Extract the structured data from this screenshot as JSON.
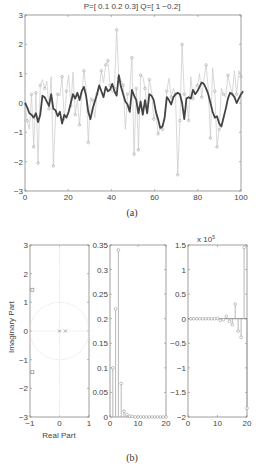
{
  "chart_data": [
    {
      "id": "a",
      "type": "line",
      "title": "P=[ 0.1    0.2    0.3]  Q=[ 1    −0.2]",
      "caption": "(a)",
      "xlabel": "",
      "ylabel": "",
      "xlim": [
        0,
        100
      ],
      "ylim": [
        -3,
        3
      ],
      "xticks": [
        "0",
        "20",
        "40",
        "60",
        "80",
        "100"
      ],
      "yticks": [
        "3",
        "2",
        "1",
        "0",
        "-1",
        "-2",
        "-3"
      ],
      "grid": false,
      "series": [
        {
          "name": "noisy samples (stem, light gray)",
          "style": "thin-gray-with-circles",
          "values": [
            0.0,
            -0.6,
            -0.9,
            0.3,
            -1.5,
            0.35,
            -2.05,
            0.6,
            0.8,
            0.5,
            0.75,
            -0.2,
            0.9,
            -2.15,
            -0.45,
            0.3,
            0.25,
            0.9,
            -0.6,
            0.4,
            0.95,
            -0.1,
            1.05,
            -0.4,
            0.1,
            -0.75,
            0.25,
            1.1,
            0.5,
            -1.35,
            0.2,
            0.1,
            -0.5,
            0.3,
            0.45,
            1.1,
            0.7,
            1.3,
            1.45,
            0.6,
            0.35,
            0.5,
            2.5,
            0.85,
            0.8,
            0.6,
            -0.9,
            0.3,
            0.4,
            1.55,
            -1.75,
            0.5,
            -1.6,
            0.95,
            0.9,
            0.5,
            -0.2,
            0.8,
            0.4,
            -0.55,
            -0.3,
            -1.05,
            -0.85,
            -0.9,
            -0.4,
            0.4,
            0.85,
            0.2,
            0.5,
            0.3,
            -2.45,
            -0.6,
            2.0,
            0.3,
            0.1,
            -0.6,
            0.9,
            0.15,
            0.5,
            0.6,
            1.0,
            0.2,
            0.8,
            1.3,
            0.5,
            -1.2,
            1.2,
            0.4,
            -1.5,
            -0.9,
            0.5,
            0.3,
            0.2,
            0.95,
            0.6,
            0.3,
            1.1,
            0.3,
            1.1,
            0.9
          ]
        },
        {
          "name": "filtered output (thick dark)",
          "style": "thick-dark-line",
          "values": [
            0.0,
            -0.15,
            -0.35,
            -0.4,
            -0.5,
            -0.35,
            -0.65,
            -0.4,
            0.25,
            0.2,
            0.05,
            -0.1,
            0.3,
            -0.2,
            -0.25,
            -0.45,
            -0.3,
            -0.7,
            -0.4,
            -0.5,
            -0.3,
            0.0,
            0.3,
            0.15,
            0.35,
            0.1,
            0.4,
            0.55,
            0.25,
            -0.3,
            -0.55,
            -0.2,
            0.05,
            0.3,
            0.6,
            0.4,
            0.2,
            0.55,
            0.4,
            0.45,
            0.65,
            0.4,
            0.25,
            0.95,
            0.55,
            0.3,
            0.05,
            -0.05,
            -0.3,
            0.45,
            0.25,
            0.1,
            -0.35,
            0.05,
            -0.4,
            0.1,
            -0.35,
            0.3,
            0.25,
            0.1,
            -0.3,
            -0.55,
            -0.85,
            -0.8,
            -0.5,
            0.2,
            0.1,
            -0.05,
            0.2,
            0.3,
            0.35,
            0.3,
            0.0,
            -0.55,
            0.15,
            0.2,
            0.15,
            0.45,
            0.3,
            0.4,
            0.55,
            0.7,
            0.65,
            0.5,
            0.3,
            0.0,
            -0.3,
            -0.5,
            -0.45,
            -0.7,
            -0.8,
            -0.5,
            -0.2,
            0.15,
            0.35,
            0.3,
            0.2,
            0.0,
            0.15,
            0.3,
            0.4
          ]
        }
      ]
    },
    {
      "id": "b1",
      "type": "scatter",
      "caption": "(b)",
      "xlabel": "Real Part",
      "ylabel": "Imaginary Part",
      "xlim": [
        -1,
        1
      ],
      "ylim": [
        -3,
        3
      ],
      "xticks": [
        "-1",
        "0",
        "1"
      ],
      "yticks": [
        "3",
        "2",
        "1",
        "0",
        "-1",
        "-2",
        "-3"
      ],
      "unit_circle": true,
      "zeros": [
        {
          "re": -0.92,
          "im": 1.44
        },
        {
          "re": -0.92,
          "im": -1.44
        }
      ],
      "poles": [
        {
          "re": 0.0,
          "im": 0.0
        },
        {
          "re": 0.2,
          "im": 0.0
        }
      ]
    },
    {
      "id": "b2",
      "type": "stem",
      "xlim": [
        0,
        20
      ],
      "ylim": [
        0,
        0.35
      ],
      "xticks": [
        "0",
        "10",
        "20"
      ],
      "yticks": [
        "0.35",
        "0.3",
        "0.25",
        "0.2",
        "0.15",
        "0.1",
        "0.05",
        "0"
      ],
      "x": [
        1,
        2,
        3,
        4,
        5,
        6,
        7,
        8,
        9,
        10,
        11,
        12,
        13,
        14,
        15,
        16,
        17,
        18,
        19,
        20
      ],
      "values": [
        0.1,
        0.22,
        0.34,
        0.068,
        0.012,
        0.005,
        0.002,
        0.001,
        0.0,
        0.0,
        0.0,
        0.0,
        0.0,
        0.0,
        0.0,
        0.0,
        0.0,
        0.0,
        0.0,
        0.0
      ]
    },
    {
      "id": "b3",
      "type": "stem",
      "ylabel_multiplier": "x 10^5",
      "multiplier_text": "x 10",
      "multiplier_exp": "5",
      "xlim": [
        0,
        20
      ],
      "ylim": [
        -2,
        1.5
      ],
      "xticks": [
        "0",
        "10",
        "20"
      ],
      "yticks": [
        "1.5",
        "1",
        "0.5",
        "0",
        "-0.5",
        "-1",
        "-1.5",
        "-2"
      ],
      "x": [
        1,
        2,
        3,
        4,
        5,
        6,
        7,
        8,
        9,
        10,
        11,
        12,
        13,
        14,
        15,
        16,
        17,
        18,
        19,
        20
      ],
      "values": [
        0.0,
        0.0,
        0.0,
        0.0,
        0.0,
        0.0,
        0.0,
        0.0,
        0.0,
        0.005,
        -0.03,
        -0.02,
        0.05,
        -0.05,
        -0.12,
        0.3,
        -0.25,
        -0.38,
        1.45,
        -1.82
      ]
    }
  ],
  "labels": {
    "title_a": "P=[ 0.1        0.2        0.3]  Q=[ 1        −0.2]",
    "caption_a": "(a)",
    "caption_b": "(b)",
    "xlabel_b1": "Real Part",
    "ylabel_b1": "Imaginary Part",
    "multiplier_b3": "x 10",
    "multiplier_b3_exp": "5"
  },
  "colors": {
    "axes": "#888888",
    "noisy_line": "#c8c8c8",
    "noisy_marker": "#a8a8a8",
    "filtered_line": "#444444",
    "stem": "#9a9a9a",
    "unit_circle": "#dcdcdc"
  }
}
